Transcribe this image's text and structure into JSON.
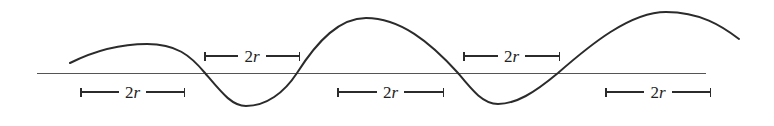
{
  "figure": {
    "kind": "wave-diagram",
    "width": 774,
    "height": 126,
    "background_color": "#ffffff",
    "stroke_color": "#2b2b2b",
    "axis_color": "#555555",
    "curve_stroke_width": 2.0,
    "axis_stroke_width": 1.0
  },
  "axis": {
    "name": "horizontal-baseline",
    "y": 73,
    "x_start": 37,
    "x_end": 706
  },
  "curve": {
    "name": "sinusoidal-curve",
    "start": {
      "x": 70,
      "y": 63
    },
    "end": {
      "x": 739,
      "y": 39
    },
    "extrema": [
      {
        "type": "peak",
        "x": 147,
        "y": 44
      },
      {
        "type": "trough",
        "x": 246,
        "y": 106
      },
      {
        "type": "peak",
        "x": 366,
        "y": 18
      },
      {
        "type": "trough",
        "x": 498,
        "y": 104
      },
      {
        "type": "peak",
        "x": 666,
        "y": 12
      }
    ],
    "zero_crossings": [
      205,
      297,
      458,
      558
    ],
    "path": "M 70,63 C 96,50 120,44 147,44 C 176,44 190,55 205,73 C 222,93 232,106 246,106 C 266,106 284,93 297,73 C 318,40 340,18 366,18 C 400,18 430,42 458,73 C 472,90 483,104 498,104 C 516,104 534,93 558,73 C 590,45 630,12 666,12 C 700,12 722,26 739,39"
  },
  "labels": [
    {
      "id": "span-1",
      "text_prefix": "2",
      "text_italic": "r",
      "position": "below-baseline",
      "x": 80,
      "y": 83,
      "width": 105
    },
    {
      "id": "span-2",
      "text_prefix": "2",
      "text_italic": "r",
      "position": "above-baseline",
      "x": 204,
      "y": 47,
      "width": 96
    },
    {
      "id": "span-3",
      "text_prefix": "2",
      "text_italic": "r",
      "position": "below-baseline",
      "x": 337,
      "y": 83,
      "width": 107
    },
    {
      "id": "span-4",
      "text_prefix": "2",
      "text_italic": "r",
      "position": "above-baseline",
      "x": 463,
      "y": 47,
      "width": 97
    },
    {
      "id": "span-5",
      "text_prefix": "2",
      "text_italic": "r",
      "position": "below-baseline",
      "x": 605,
      "y": 83,
      "width": 106
    }
  ],
  "chart_data": {
    "type": "line",
    "title": "",
    "xlabel": "",
    "ylabel": "",
    "grid": false,
    "legend": "none",
    "annotations": [
      "2r",
      "2r",
      "2r",
      "2r",
      "2r"
    ],
    "series": [
      {
        "name": "wave",
        "x": [
          70,
          147,
          205,
          246,
          297,
          366,
          458,
          498,
          558,
          666,
          739
        ],
        "y": [
          10,
          29,
          0,
          -33,
          0,
          55,
          0,
          -31,
          0,
          61,
          34
        ]
      }
    ],
    "baseline": 0
  }
}
